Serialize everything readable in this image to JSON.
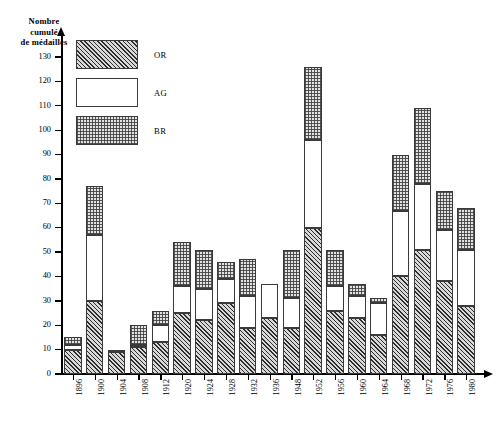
{
  "chart_data": {
    "type": "bar",
    "title": "",
    "ylabel": "Nombre cumulé de médailles",
    "xlabel": "",
    "ylim": [
      0,
      130
    ],
    "ytick_step": 10,
    "yticks": [
      0,
      10,
      20,
      30,
      40,
      50,
      60,
      70,
      80,
      90,
      100,
      110,
      120,
      130
    ],
    "grid": false,
    "stacked": true,
    "legend_position": "top-left",
    "categories": [
      "1896",
      "1900",
      "1904",
      "1908",
      "1912",
      "1920",
      "1924",
      "1928",
      "1932",
      "1936",
      "1948",
      "1952",
      "1956",
      "1960",
      "1964",
      "1968",
      "1972",
      "1976",
      "1980"
    ],
    "series": [
      {
        "name": "OR",
        "values": [
          10,
          30,
          9,
          11,
          13,
          25,
          22,
          29,
          19,
          23,
          19,
          60,
          26,
          23,
          16,
          40,
          51,
          38,
          28
        ]
      },
      {
        "name": "AG",
        "values": [
          2,
          27,
          0,
          1,
          7,
          11,
          13,
          10,
          13,
          14,
          12,
          36,
          10,
          9,
          13,
          27,
          27,
          21,
          23
        ]
      },
      {
        "name": "BR",
        "values": [
          3,
          20,
          1,
          8,
          6,
          18,
          16,
          7,
          15,
          0,
          20,
          30,
          15,
          5,
          2,
          23,
          31,
          16,
          17
        ]
      }
    ],
    "cumulative_tops": {
      "OR": [
        10,
        30,
        9,
        11,
        13,
        25,
        22,
        29,
        19,
        23,
        19,
        60,
        26,
        23,
        16,
        40,
        51,
        38,
        28
      ],
      "AG": [
        12,
        57,
        9,
        12,
        20,
        36,
        35,
        39,
        32,
        37,
        31,
        96,
        36,
        32,
        29,
        67,
        78,
        59,
        51
      ],
      "BR": [
        15,
        77,
        10,
        20,
        26,
        54,
        51,
        46,
        47,
        37,
        51,
        126,
        51,
        37,
        31,
        90,
        109,
        75,
        68
      ]
    }
  },
  "legend": {
    "items": [
      {
        "key": "OR",
        "label": "OR",
        "style": "diagonal-hatch"
      },
      {
        "key": "AG",
        "label": "AG",
        "style": "white"
      },
      {
        "key": "BR",
        "label": "BR",
        "style": "stipple"
      }
    ]
  },
  "axis": {
    "y_title_lines": [
      "Nombre",
      "cumulé",
      "de  médailles"
    ]
  }
}
